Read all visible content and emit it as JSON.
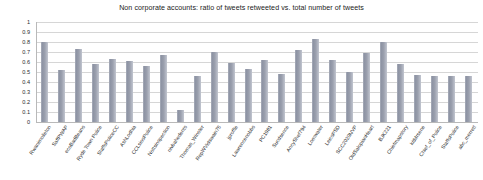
{
  "chart_data": {
    "type": "bar",
    "title": "Non corporate accounts: ratio of tweets retweeted vs. total number of tweets",
    "xlabel": "",
    "ylabel": "",
    "ylim": [
      0,
      1
    ],
    "ytick_labels": [
      "1",
      "0.9",
      "0.8",
      "0.7",
      "0.6",
      "0.5",
      "0.4",
      "0.3",
      "0.2",
      "0.1",
      "0"
    ],
    "ytick_values": [
      1,
      0.9,
      0.8,
      0.7,
      0.6,
      0.5,
      0.4,
      0.3,
      0.2,
      0.1,
      0
    ],
    "grid": true,
    "legend": false,
    "bar_color": "#9ba0ae",
    "categories": [
      "Rwanimolleton",
      "SaffPWAP",
      "ecoBadBeans",
      "Ryde Town Police",
      "StaffsPoliceCC",
      "AshLodhia",
      "CCLsiosPolice",
      "Nottsinspection",
      "nivbahedents",
      "Thomas_Winster",
      "RepWVidswain76",
      "jproffle",
      "Lawrencenobbs",
      "PC1981",
      "Sucdsence",
      "AncyShef794",
      "Lomwater",
      "LeicsPSD",
      "SCC2020NVP",
      "OldSalopianHeart",
      "BJK221",
      "Chiefmapstory",
      "kitMrsene",
      "Chief_of_Police",
      "StaffsPolice",
      "abc_merrett"
    ],
    "values": [
      0.8,
      0.52,
      0.73,
      0.58,
      0.63,
      0.61,
      0.56,
      0.67,
      0.12,
      0.46,
      0.7,
      0.59,
      0.53,
      0.62,
      0.48,
      0.72,
      0.83,
      0.62,
      0.5,
      0.69,
      0.8,
      0.58,
      0.47,
      0.46,
      0.46,
      0.46
    ]
  }
}
